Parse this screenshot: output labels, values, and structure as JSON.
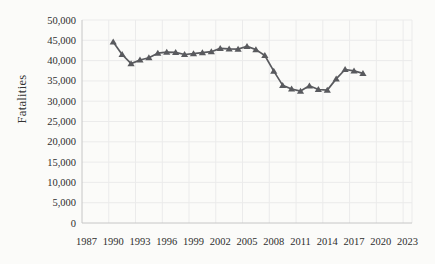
{
  "colors": {
    "series": "#595a5e",
    "grid": "#ebebeb",
    "axis": "#c6c6c6",
    "text": "#2e2e2e",
    "divider": "#1b1b1b",
    "background": "#fbfbf9"
  },
  "chart_data": {
    "type": "line",
    "title": "",
    "xlabel": "",
    "ylabel": "Fatalities",
    "grid": "on",
    "legend": "none",
    "xlim": [
      1986.5,
      2023.5
    ],
    "ylim": [
      0,
      50000
    ],
    "x_tick_years": [
      1987,
      1990,
      1993,
      1996,
      1999,
      2002,
      2005,
      2008,
      2011,
      2014,
      2017,
      2020,
      2023
    ],
    "x_tick_labels": [
      "1987",
      "1990",
      "1993",
      "1996",
      "1999",
      "2002",
      "2005",
      "2008",
      "2011",
      "2014",
      "2017",
      "2020",
      "2023"
    ],
    "x_gridline_step_years": 3,
    "y_tick_values": [
      0,
      5000,
      10000,
      15000,
      20000,
      25000,
      30000,
      35000,
      40000,
      45000,
      50000
    ],
    "y_tick_labels": [
      "0",
      "5,000",
      "10,000",
      "15,000",
      "20,000",
      "25,000",
      "30,000",
      "35,000",
      "40,000",
      "45,000",
      "50,000"
    ],
    "series": [
      {
        "name": "Fatalities",
        "marker": "triangle-up",
        "color": "#595a5e",
        "x": [
          1990,
          1991,
          1992,
          1993,
          1994,
          1995,
          1996,
          1997,
          1998,
          1999,
          2000,
          2001,
          2002,
          2003,
          2004,
          2005,
          2006,
          2007,
          2008,
          2009,
          2010,
          2011,
          2012,
          2013,
          2014,
          2015,
          2016,
          2017,
          2018
        ],
        "values": [
          44599,
          41508,
          39250,
          40150,
          40716,
          41817,
          42065,
          42013,
          41501,
          41717,
          41945,
          42196,
          43005,
          42884,
          42836,
          43510,
          42708,
          41259,
          37423,
          33883,
          32999,
          32479,
          33782,
          32893,
          32744,
          35484,
          37806,
          37473,
          36835
        ]
      }
    ]
  },
  "divider_rule": {
    "present": true
  }
}
